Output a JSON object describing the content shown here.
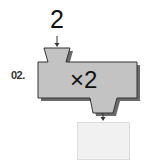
{
  "problem": {
    "number_label": "02.",
    "input_value": "2",
    "operation": "×2",
    "output_value": ""
  },
  "colors": {
    "machine_fill": "#c3c3c3",
    "machine_shadow": "#6a6a6a",
    "machine_stroke": "#333333",
    "output_box_fill": "#f1f1f1"
  }
}
